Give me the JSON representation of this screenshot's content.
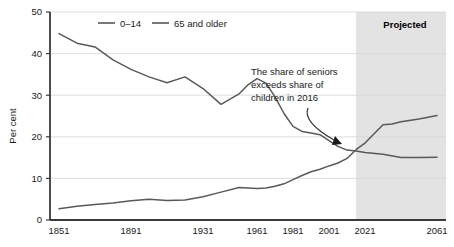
{
  "chart_data": {
    "type": "line",
    "title": "",
    "xlabel": "",
    "ylabel": "Per cent",
    "xlim": [
      1846,
      2066
    ],
    "ylim": [
      0,
      50
    ],
    "grid": true,
    "legend_position": "top-center",
    "x_ticks": [
      "1851",
      "1891",
      "1931",
      "1961",
      "1981",
      "2001",
      "2021",
      "2061"
    ],
    "x_tick_values": [
      1851,
      1891,
      1931,
      1961,
      1981,
      2001,
      2021,
      2061
    ],
    "y_ticks": [
      "0",
      "10",
      "20",
      "30",
      "40",
      "50"
    ],
    "y_tick_values": [
      0,
      10,
      20,
      30,
      40,
      50
    ],
    "series": [
      {
        "name": "0–14",
        "color": "#58595b",
        "x": [
          1851,
          1861,
          1871,
          1881,
          1891,
          1901,
          1911,
          1921,
          1931,
          1941,
          1951,
          1956,
          1961,
          1966,
          1971,
          1976,
          1981,
          1986,
          1991,
          1996,
          2001,
          2006,
          2011,
          2016,
          2021,
          2031,
          2041,
          2051,
          2061
        ],
        "values": [
          44.8,
          42.5,
          41.6,
          38.5,
          36.2,
          34.4,
          33.0,
          34.4,
          31.6,
          27.8,
          30.3,
          32.5,
          34.0,
          32.9,
          29.6,
          25.6,
          22.5,
          21.3,
          20.9,
          20.5,
          19.1,
          17.7,
          16.8,
          16.6,
          16.2,
          15.8,
          15.0,
          15.0,
          15.1
        ]
      },
      {
        "name": "65 and older",
        "color": "#58595b",
        "x": [
          1851,
          1861,
          1871,
          1881,
          1891,
          1901,
          1911,
          1921,
          1931,
          1941,
          1951,
          1956,
          1961,
          1966,
          1971,
          1976,
          1981,
          1986,
          1991,
          1996,
          2001,
          2006,
          2011,
          2016,
          2021,
          2031,
          2036,
          2041,
          2051,
          2061
        ],
        "values": [
          2.7,
          3.3,
          3.7,
          4.1,
          4.6,
          5.0,
          4.7,
          4.8,
          5.6,
          6.7,
          7.8,
          7.7,
          7.6,
          7.7,
          8.1,
          8.7,
          9.7,
          10.7,
          11.6,
          12.2,
          13.0,
          13.7,
          14.8,
          16.9,
          18.5,
          22.9,
          23.1,
          23.6,
          24.3,
          25.1
        ]
      }
    ],
    "annotations": [
      {
        "name": "crossover-note",
        "lines": [
          "The share of seniors",
          "exceeds share of",
          "children in 2016"
        ],
        "arrow_target_year": 2012,
        "arrow_target_value": 18.5
      }
    ],
    "shaded_regions": [
      {
        "name": "projected",
        "label": "Projected",
        "start_year": 2016,
        "end_year": 2066,
        "color": "#e3e3e3"
      }
    ]
  }
}
